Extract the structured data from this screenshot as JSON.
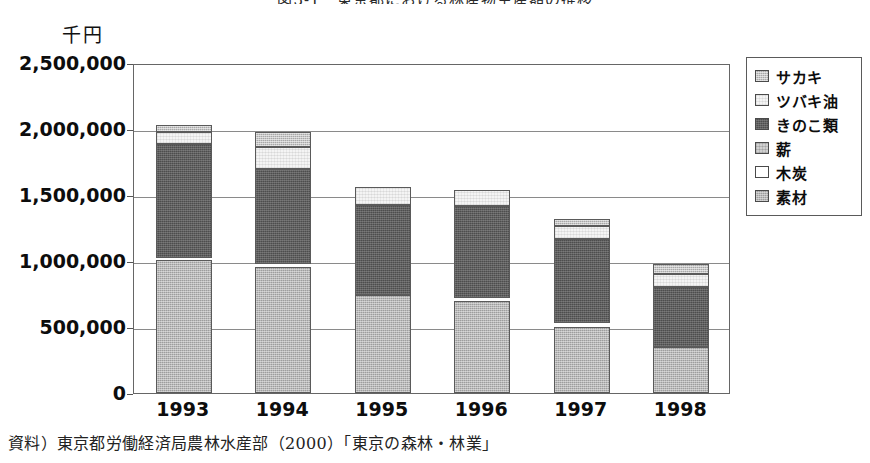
{
  "figure": {
    "title": "図3-1　東京都における林産物生産額の推移",
    "unit_label": "千円",
    "source_note": "資料）東京都労働経済局農林水産部（2000）「東京の森林・林業」"
  },
  "legend": {
    "items": [
      {
        "label": "サカキ",
        "key": "sakaki",
        "color": "#a8a8a8"
      },
      {
        "label": "ツバキ油",
        "key": "tsubaki",
        "color": "#f4f4f4"
      },
      {
        "label": "きのこ類",
        "key": "kinoko",
        "color": "#4d4d4d"
      },
      {
        "label": "薪",
        "key": "maki",
        "color": "#d0d0d0"
      },
      {
        "label": "木炭",
        "key": "mokutan",
        "color": "#ffffff"
      },
      {
        "label": "素材",
        "key": "sozai",
        "color": "#9d9d9d"
      }
    ]
  },
  "axis": {
    "y_ticks": [
      "2,500,000",
      "2,000,000",
      "1,500,000",
      "1,000,000",
      "500,000",
      "0"
    ],
    "x_ticks": [
      "1993",
      "1994",
      "1995",
      "1996",
      "1997",
      "1998"
    ]
  },
  "chart_data": {
    "type": "bar",
    "subtype": "stacked",
    "title": "図3-1　東京都における林産物生産額の推移",
    "xlabel": "",
    "ylabel": "千円",
    "ylim": [
      0,
      2500000
    ],
    "ytick_step": 500000,
    "grid": true,
    "legend_position": "right",
    "categories": [
      "1993",
      "1994",
      "1995",
      "1996",
      "1997",
      "1998"
    ],
    "series": [
      {
        "name": "素材",
        "values": [
          975000,
          955000,
          745000,
          700000,
          555000,
          355000
        ]
      },
      {
        "name": "木炭",
        "values": [
          10000,
          10000,
          10000,
          10000,
          10000,
          10000
        ]
      },
      {
        "name": "薪",
        "values": [
          10000,
          10000,
          10000,
          10000,
          10000,
          10000
        ]
      },
      {
        "name": "きのこ類",
        "values": [
          880000,
          715000,
          675000,
          690000,
          605000,
          455000
        ]
      },
      {
        "name": "ツバキ油",
        "values": [
          85000,
          170000,
          130000,
          115000,
          65000,
          95000
        ]
      },
      {
        "name": "サカキ",
        "values": [
          45000,
          85000,
          0,
          0,
          35000,
          70000
        ]
      }
    ],
    "totals": [
      2005000,
      1945000,
      1570000,
      1525000,
      1270000,
      985000
    ]
  },
  "bars": [
    {
      "year": "1993",
      "total": 2005000,
      "segments": [
        {
          "key": "sozai",
          "label": "素材",
          "top": 261,
          "bottom": 394
        },
        {
          "key": "kinoko",
          "label": "きのこ類",
          "top": 145,
          "bottom": 259
        },
        {
          "key": "tsubaki",
          "label": "ツバキ油",
          "top": 133,
          "bottom": 145
        },
        {
          "key": "sakaki",
          "label": "サカキ",
          "top": 126,
          "bottom": 133
        }
      ]
    },
    {
      "year": "1994",
      "total": 1945000,
      "segments": [
        {
          "key": "sozai",
          "label": "素材",
          "top": 268,
          "bottom": 394
        },
        {
          "key": "kinoko",
          "label": "きのこ類",
          "top": 170,
          "bottom": 265
        },
        {
          "key": "tsubaki",
          "label": "ツバキ油",
          "top": 148,
          "bottom": 170
        },
        {
          "key": "sakaki",
          "label": "サカキ",
          "top": 133,
          "bottom": 148
        }
      ]
    },
    {
      "year": "1995",
      "total": 1570000,
      "segments": [
        {
          "key": "sozai",
          "label": "素材",
          "top": 296,
          "bottom": 394
        },
        {
          "key": "kinoko",
          "label": "きのこ類",
          "top": 206,
          "bottom": 296
        },
        {
          "key": "tsubaki",
          "label": "ツバキ油",
          "top": 188,
          "bottom": 206
        }
      ]
    },
    {
      "year": "1996",
      "total": 1525000,
      "segments": [
        {
          "key": "sozai",
          "label": "素材",
          "top": 302,
          "bottom": 394
        },
        {
          "key": "kinoko",
          "label": "きのこ類",
          "top": 207,
          "bottom": 299
        },
        {
          "key": "tsubaki",
          "label": "ツバキ油",
          "top": 191,
          "bottom": 207
        }
      ]
    },
    {
      "year": "1997",
      "total": 1270000,
      "segments": [
        {
          "key": "sozai",
          "label": "素材",
          "top": 328,
          "bottom": 394
        },
        {
          "key": "kinoko",
          "label": "きのこ類",
          "top": 240,
          "bottom": 324
        },
        {
          "key": "tsubaki",
          "label": "ツバキ油",
          "top": 227,
          "bottom": 240
        },
        {
          "key": "sakaki",
          "label": "サカキ",
          "top": 220,
          "bottom": 227
        }
      ]
    },
    {
      "year": "1998",
      "total": 985000,
      "segments": [
        {
          "key": "sozai",
          "label": "素材",
          "top": 348,
          "bottom": 394
        },
        {
          "key": "kinoko",
          "label": "きのこ類",
          "top": 288,
          "bottom": 348
        },
        {
          "key": "tsubaki",
          "label": "ツバキ油",
          "top": 275,
          "bottom": 288
        },
        {
          "key": "sakaki",
          "label": "サカキ",
          "top": 265,
          "bottom": 275
        }
      ]
    }
  ]
}
